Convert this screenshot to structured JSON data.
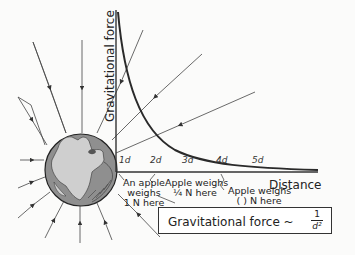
{
  "diagram": {
    "y_axis_label": "Gravitational force",
    "x_axis_label": "Distance",
    "ticks": [
      "1d",
      "2d",
      "3d",
      "4d",
      "5d"
    ],
    "annotations": {
      "at_1d": [
        "An apple",
        "weighs",
        "1 N here"
      ],
      "at_2d": [
        "Apple weighs",
        "¼ N here"
      ],
      "at_4d": [
        "Apple weighs",
        "( ) N here"
      ]
    },
    "formula": {
      "text": "Gravitational force ~",
      "numerator": "1",
      "denominator": "d²"
    },
    "colors": {
      "curve": "#2a2a2a",
      "axis": "#333333",
      "earth_land": "#cfcfcf",
      "earth_ocean": "#8f8f8f",
      "field_lines": "#444444"
    }
  }
}
